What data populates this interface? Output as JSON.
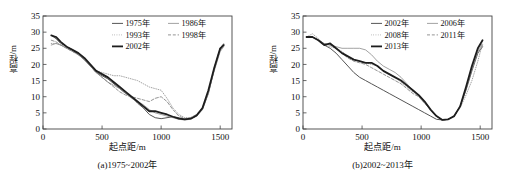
{
  "figure": {
    "axis_x_label": "起点距/m",
    "axis_y_label": "高程/m"
  },
  "panels": [
    {
      "id": "a",
      "caption": "(a)1975~2002年",
      "x_label": "起点距/m",
      "y_label": "高程/m",
      "legend": [
        {
          "label": "1975年",
          "style": "solid",
          "width": 1.0,
          "color": "#555555"
        },
        {
          "label": "1986年",
          "style": "solid",
          "width": 0.8,
          "color": "#8a8a8a"
        },
        {
          "label": "1993年",
          "style": "dotted",
          "width": 0.9,
          "color": "#9a9a9a"
        },
        {
          "label": "1998年",
          "style": "dashed",
          "width": 0.9,
          "color": "#888888"
        },
        {
          "label": "2002年",
          "style": "solid",
          "width": 1.8,
          "color": "#1d1d1d"
        }
      ]
    },
    {
      "id": "b",
      "caption": "(b)2002~2013年",
      "x_label": "起点距/m",
      "y_label": "高程/m",
      "legend": [
        {
          "label": "2002年",
          "style": "solid",
          "width": 1.0,
          "color": "#555555"
        },
        {
          "label": "2006年",
          "style": "solid",
          "width": 0.8,
          "color": "#8a8a8a"
        },
        {
          "label": "2008年",
          "style": "dotted",
          "width": 0.9,
          "color": "#9a9a9a"
        },
        {
          "label": "2011年",
          "style": "dashed",
          "width": 0.9,
          "color": "#888888"
        },
        {
          "label": "2013年",
          "style": "solid",
          "width": 1.8,
          "color": "#1d1d1d"
        }
      ]
    }
  ],
  "chart_data": [
    {
      "type": "line",
      "title": "(a)1975~2002年",
      "xlabel": "起点距/m",
      "ylabel": "高程/m",
      "xlim": [
        0,
        1600
      ],
      "ylim": [
        0,
        35
      ],
      "xticks": [
        0,
        500,
        1000,
        1500
      ],
      "yticks": [
        0,
        5,
        10,
        15,
        20,
        25,
        30,
        35
      ],
      "grid": false,
      "legend_position": "top-right",
      "x": [
        70,
        110,
        150,
        200,
        250,
        300,
        350,
        400,
        450,
        500,
        550,
        600,
        650,
        700,
        750,
        800,
        850,
        900,
        950,
        1000,
        1050,
        1100,
        1150,
        1200,
        1250,
        1300,
        1350,
        1400,
        1450,
        1500,
        1530
      ],
      "series": [
        {
          "name": "1975年",
          "values": [
            29.0,
            28.0,
            26.5,
            25.5,
            24.5,
            23.0,
            21.5,
            19.5,
            17.5,
            16.5,
            15.5,
            14.0,
            12.5,
            11.0,
            10.0,
            8.0,
            6.5,
            4.5,
            3.5,
            3.2,
            3.5,
            3.8,
            3.5,
            3.0,
            3.2,
            4.0,
            6.0,
            11.0,
            18.5,
            24.5,
            26.0
          ]
        },
        {
          "name": "1986年",
          "values": [
            26.0,
            26.5,
            26.0,
            25.0,
            24.0,
            23.0,
            21.5,
            19.5,
            17.5,
            16.0,
            14.5,
            13.5,
            12.5,
            11.0,
            9.5,
            8.5,
            7.5,
            6.0,
            5.0,
            4.5,
            4.0,
            3.5,
            3.0,
            2.8,
            3.0,
            4.0,
            6.5,
            11.5,
            18.0,
            24.0,
            25.5
          ]
        },
        {
          "name": "1993年",
          "values": [
            26.5,
            26.5,
            26.0,
            25.5,
            24.5,
            23.5,
            22.0,
            20.0,
            18.0,
            17.5,
            17.0,
            16.5,
            16.5,
            16.0,
            15.5,
            15.0,
            14.0,
            13.0,
            12.5,
            12.0,
            9.5,
            6.5,
            4.5,
            3.5,
            3.5,
            4.5,
            6.5,
            11.0,
            18.5,
            25.0,
            26.5
          ]
        },
        {
          "name": "1998年",
          "values": [
            27.5,
            27.0,
            26.0,
            25.0,
            24.0,
            23.0,
            21.5,
            19.5,
            17.5,
            16.0,
            14.5,
            13.0,
            11.5,
            10.5,
            10.0,
            9.5,
            9.0,
            8.5,
            9.5,
            10.0,
            8.5,
            6.0,
            4.0,
            3.2,
            3.5,
            4.5,
            6.5,
            11.5,
            19.0,
            25.0,
            26.5
          ]
        },
        {
          "name": "2002年",
          "values": [
            29.0,
            28.5,
            27.0,
            25.5,
            24.5,
            23.5,
            22.0,
            20.0,
            18.0,
            17.0,
            16.0,
            14.5,
            13.0,
            11.5,
            10.0,
            8.5,
            7.0,
            5.5,
            5.5,
            5.0,
            4.5,
            3.8,
            3.2,
            3.0,
            3.2,
            4.2,
            6.5,
            12.0,
            19.0,
            25.0,
            26.0
          ]
        }
      ]
    },
    {
      "type": "line",
      "title": "(b)2002~2013年",
      "xlabel": "起点距/m",
      "ylabel": "高程/m",
      "xlim": [
        0,
        1600
      ],
      "ylim": [
        0,
        35
      ],
      "xticks": [
        0,
        500,
        1000,
        1500
      ],
      "yticks": [
        0,
        5,
        10,
        15,
        20,
        25,
        30,
        35
      ],
      "grid": false,
      "legend_position": "top-right",
      "x": [
        30,
        80,
        130,
        180,
        230,
        280,
        330,
        380,
        430,
        480,
        530,
        580,
        630,
        680,
        730,
        780,
        830,
        880,
        930,
        980,
        1030,
        1080,
        1130,
        1180,
        1230,
        1280,
        1330,
        1380,
        1430,
        1480,
        1520
      ],
      "series": [
        {
          "name": "2002年",
          "values": [
            28.5,
            28.5,
            27.5,
            26.0,
            25.0,
            23.5,
            21.5,
            19.5,
            17.5,
            16.0,
            15.0,
            14.0,
            13.0,
            12.0,
            11.0,
            10.0,
            9.0,
            8.0,
            7.0,
            6.0,
            5.0,
            4.0,
            3.0,
            2.8,
            3.0,
            4.0,
            7.0,
            12.0,
            18.0,
            23.5,
            25.5
          ]
        },
        {
          "name": "2006年",
          "values": [
            28.5,
            28.5,
            27.5,
            26.5,
            26.0,
            25.5,
            25.0,
            25.0,
            25.0,
            25.0,
            24.5,
            23.0,
            21.0,
            19.5,
            18.5,
            17.5,
            16.0,
            14.0,
            12.0,
            10.0,
            8.0,
            6.0,
            4.0,
            2.8,
            3.0,
            4.0,
            7.0,
            12.5,
            18.5,
            24.0,
            26.0
          ]
        },
        {
          "name": "2008年",
          "values": [
            28.5,
            29.5,
            28.0,
            26.0,
            25.5,
            25.0,
            24.0,
            22.5,
            21.5,
            21.0,
            20.5,
            20.0,
            19.5,
            18.0,
            17.0,
            16.0,
            14.5,
            13.0,
            11.5,
            10.5,
            8.5,
            6.0,
            4.0,
            2.8,
            3.0,
            4.0,
            6.5,
            10.5,
            15.0,
            21.0,
            26.5
          ]
        },
        {
          "name": "2011年",
          "values": [
            28.5,
            28.5,
            27.5,
            26.5,
            26.0,
            25.0,
            23.5,
            22.0,
            21.0,
            20.5,
            20.0,
            19.0,
            18.0,
            17.0,
            16.0,
            15.0,
            14.0,
            12.5,
            11.0,
            10.0,
            8.0,
            6.0,
            4.0,
            2.8,
            3.0,
            4.0,
            7.0,
            12.5,
            19.0,
            24.5,
            26.5
          ]
        },
        {
          "name": "2013年",
          "values": [
            28.5,
            28.5,
            27.5,
            26.0,
            26.5,
            25.0,
            23.5,
            22.5,
            21.5,
            21.0,
            20.5,
            20.5,
            19.5,
            18.0,
            17.0,
            16.0,
            15.0,
            13.5,
            12.0,
            10.5,
            8.5,
            6.0,
            4.0,
            2.8,
            3.0,
            4.0,
            7.0,
            13.0,
            19.5,
            25.0,
            27.5
          ]
        }
      ]
    }
  ]
}
